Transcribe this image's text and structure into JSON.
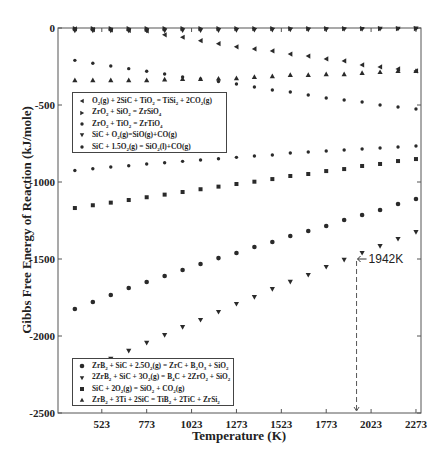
{
  "chart_data": {
    "type": "scatter",
    "title": "",
    "xlabel": "Temperature (K)",
    "ylabel": "Gibbs Free Energy of Reaction (kJ/mole)",
    "xlim": [
      279,
      2301
    ],
    "ylim": [
      -2500,
      0
    ],
    "grid": false,
    "x_ticks": [
      523,
      773,
      1023,
      1273,
      1523,
      1773,
      2023,
      2273
    ],
    "y_ticks": [
      0,
      -500,
      -1000,
      -1500,
      -2000,
      -2500
    ],
    "x": [
      373,
      473,
      573,
      673,
      773,
      873,
      973,
      1073,
      1173,
      1273,
      1373,
      1473,
      1573,
      1673,
      1773,
      1873,
      1973,
      2073,
      2173,
      2273
    ],
    "series": [
      {
        "name": "O2(g) + 2SiC + TiO2 = TiSi2 + 2CO2(g)",
        "marker": "triangle-left",
        "legend": 1,
        "values": [
          -6,
          -10,
          -13,
          -16,
          -19,
          -44,
          -60,
          -82,
          -102,
          -122,
          -136,
          -149,
          -169,
          -182,
          -201,
          -214,
          -240,
          -253,
          -266,
          -279
        ]
      },
      {
        "name": "ZrO2 + SiO2 = ZrSiO4",
        "marker": "triangle-right",
        "legend": 1,
        "values": [
          -4,
          -4,
          -4,
          -4,
          -4,
          -4,
          -4,
          -4,
          -4,
          -4,
          -4,
          -4,
          -4,
          -4,
          -4,
          -4,
          -4,
          -4,
          -4,
          -4
        ]
      },
      {
        "name": "ZrO2 + TiO2 = ZrTiO4",
        "marker": "dot",
        "legend": 1,
        "values": [
          -210,
          -229,
          -247,
          -264,
          -281,
          -299,
          -318,
          -331,
          -347,
          -364,
          -383,
          -403,
          -416,
          -435,
          -455,
          -468,
          -481,
          -500,
          -513,
          -526
        ]
      },
      {
        "name": "SiC + O2(g)=SiO(g)+CO(g)",
        "marker": "triangle-down",
        "legend": 1,
        "values": [
          -18,
          -18,
          -18,
          -18,
          -18,
          -18,
          -16,
          -16,
          -15,
          -14,
          -13,
          -12,
          -11,
          -10,
          -9,
          -8,
          -7,
          -6,
          -5,
          -4
        ]
      },
      {
        "name": "SiC + 1.5O2(g) = SiO2(l)+CO(g)",
        "marker": "dot",
        "legend": 1,
        "values": [
          -925,
          -914,
          -903,
          -894,
          -883,
          -875,
          -866,
          -857,
          -849,
          -840,
          -831,
          -825,
          -812,
          -805,
          -799,
          -792,
          -786,
          -779,
          -773,
          -766
        ]
      },
      {
        "name": "ZrB2 + SiC + 2.5O2(g) = ZrC + B2O3 + SiO2",
        "marker": "circle",
        "legend": 2,
        "values": [
          -1825,
          -1779,
          -1734,
          -1688,
          -1649,
          -1610,
          -1571,
          -1532,
          -1494,
          -1461,
          -1422,
          -1390,
          -1351,
          -1318,
          -1286,
          -1247,
          -1214,
          -1182,
          -1143,
          -1110
        ]
      },
      {
        "name": "2ZrB2 + SiC + 3O2(g) = B4C + 2ZrO2 + SiO2",
        "marker": "triangle-down",
        "legend": 2,
        "values": [
          -2253,
          -2201,
          -2149,
          -2097,
          -2045,
          -1994,
          -1942,
          -1896,
          -1844,
          -1792,
          -1747,
          -1695,
          -1649,
          -1604,
          -1552,
          -1506,
          -1461,
          -1416,
          -1370,
          -1325
        ]
      },
      {
        "name": "SiC + 2O2(g) = SiO2 + CO2(g)",
        "marker": "square",
        "legend": 2,
        "values": [
          -1169,
          -1151,
          -1134,
          -1117,
          -1099,
          -1082,
          -1065,
          -1047,
          -1030,
          -1013,
          -998,
          -981,
          -961,
          -948,
          -929,
          -916,
          -896,
          -883,
          -864,
          -851
        ]
      },
      {
        "name": "ZrB2 + 3Ti + 2SiC = TiB2 + 2TiC + ZrSi2",
        "marker": "triangle-up",
        "legend": 2,
        "values": [
          -338,
          -338,
          -338,
          -338,
          -338,
          -334,
          -331,
          -331,
          -328,
          -325,
          -318,
          -312,
          -305,
          -305,
          -299,
          -299,
          -292,
          -286,
          -279,
          -279
        ]
      }
    ],
    "annotations": [
      {
        "text": "1942K",
        "x": 1942,
        "y": -1500,
        "arrow": "left",
        "dashed_vertical_line_to_axis": true
      }
    ],
    "legends": [
      {
        "position": "upper-left-inner",
        "entries": [
          {
            "marker": "triangle-left",
            "html": "O<sub>2</sub>(g) + 2SiC + TiO<sub>2</sub> = TiSi<sub>2</sub> + 2CO<sub>2</sub>(g)"
          },
          {
            "marker": "triangle-right",
            "html": "ZrO<sub>2</sub> + SiO<sub>2</sub> = ZrSiO<sub>4</sub>"
          },
          {
            "marker": "dot",
            "html": "ZrO<sub>2</sub> + TiO<sub>2</sub> = ZrTiO<sub>4</sub>"
          },
          {
            "marker": "triangle-down",
            "html": "SiC + O<sub>2</sub>(g)=SiO(g)+CO(g)"
          },
          {
            "marker": "dot",
            "html": "SiC + 1.5O<sub>2</sub>(g) = SiO<sub>2</sub>(l)+CO(g)"
          }
        ]
      },
      {
        "position": "lower-left-inner",
        "entries": [
          {
            "marker": "circle",
            "html": "ZrB<sub>2</sub> + SiC + 2.5O<sub>2</sub>(g) = ZrC + B<sub>2</sub>O<sub>3</sub> + SiO<sub>2</sub>"
          },
          {
            "marker": "triangle-down",
            "html": "2ZrB<sub>2</sub> + SiC + 3O<sub>2</sub>(g) = B<sub>4</sub>C + 2ZrO<sub>2</sub> + SiO<sub>2</sub>"
          },
          {
            "marker": "square",
            "html": "SiC + 2O<sub>2</sub>(g) = SiO<sub>2</sub> + CO<sub>2</sub>(g)"
          },
          {
            "marker": "triangle-up",
            "html": "ZrB<sub>2</sub> + 3Ti + 2SiC = TiB<sub>2</sub> + 2TiC + ZrSi<sub>2</sub>"
          }
        ]
      }
    ]
  },
  "colors": {
    "marker": "#2a2a2a",
    "axis": "#555555",
    "text": "#222222",
    "background": "#ffffff"
  }
}
